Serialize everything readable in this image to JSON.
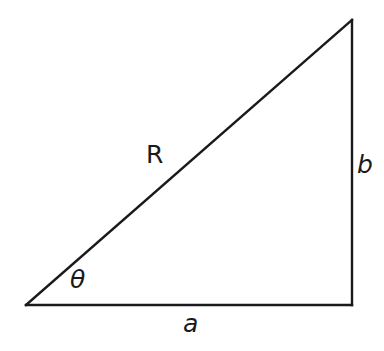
{
  "figure": {
    "kind": "right-triangle-diagram",
    "background_color": "#ffffff",
    "stroke_color": "#1a1a1a",
    "stroke_width_px": 2,
    "vertices": {
      "angle_vertex": {
        "x": 26,
        "y": 305
      },
      "right_angle_vertex": {
        "x": 352,
        "y": 305
      },
      "top_vertex": {
        "x": 352,
        "y": 20
      }
    },
    "sides": {
      "hypotenuse_label": "R",
      "vertical_leg_label": "b",
      "horizontal_leg_label": "a"
    },
    "angle_label": "θ"
  },
  "labels": {
    "hypotenuse": "R",
    "vertical_leg": "b",
    "horizontal_leg": "a",
    "angle": "θ"
  }
}
